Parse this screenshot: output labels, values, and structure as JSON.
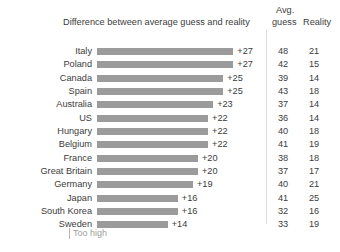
{
  "top_clip_text": "",
  "header": {
    "difference_label": "Difference between average guess and reality",
    "avg_line1": "Avg.",
    "avg_line2": "guess",
    "reality_label": "Reality"
  },
  "legend": {
    "too_high": "Too high"
  },
  "chart_data": {
    "type": "bar",
    "title": "Difference between average guess and reality",
    "xlabel": "",
    "ylabel": "",
    "orientation": "horizontal",
    "grid": false,
    "legend_position": "bottom-left",
    "legend_entries": [
      "Too high"
    ],
    "xlim": [
      0,
      30
    ],
    "categories": [
      "Italy",
      "Poland",
      "Canada",
      "Spain",
      "Australia",
      "US",
      "Hungary",
      "Belgium",
      "France",
      "Great Britain",
      "Germany",
      "Japan",
      "South Korea",
      "Sweden"
    ],
    "values": [
      27,
      27,
      25,
      25,
      23,
      22,
      22,
      22,
      20,
      20,
      19,
      16,
      16,
      14
    ],
    "value_labels": [
      "+27",
      "+27",
      "+25",
      "+25",
      "+23",
      "+22",
      "+22",
      "+22",
      "+20",
      "+20",
      "+19",
      "+16",
      "+16",
      "+14"
    ],
    "columns": [
      "Difference between average guess and reality",
      "Avg. guess",
      "Reality"
    ],
    "series": [
      {
        "name": "Difference",
        "values": [
          27,
          27,
          25,
          25,
          23,
          22,
          22,
          22,
          20,
          20,
          19,
          16,
          16,
          14
        ]
      },
      {
        "name": "Avg. guess",
        "values": [
          48,
          42,
          39,
          43,
          37,
          36,
          40,
          41,
          38,
          37,
          40,
          41,
          32,
          33
        ]
      },
      {
        "name": "Reality",
        "values": [
          21,
          15,
          14,
          18,
          14,
          14,
          18,
          19,
          18,
          17,
          21,
          25,
          16,
          19
        ]
      }
    ],
    "colors": {
      "bar": "#9b9b9b",
      "text": "#3c3c3c",
      "legend_text": "#a0a0a0"
    }
  },
  "rows": [
    {
      "country": "Italy",
      "diff": "+27",
      "avg": "48",
      "reality": "21"
    },
    {
      "country": "Poland",
      "diff": "+27",
      "avg": "42",
      "reality": "15"
    },
    {
      "country": "Canada",
      "diff": "+25",
      "avg": "39",
      "reality": "14"
    },
    {
      "country": "Spain",
      "diff": "+25",
      "avg": "43",
      "reality": "18"
    },
    {
      "country": "Australia",
      "diff": "+23",
      "avg": "37",
      "reality": "14"
    },
    {
      "country": "US",
      "diff": "+22",
      "avg": "36",
      "reality": "14"
    },
    {
      "country": "Hungary",
      "diff": "+22",
      "avg": "40",
      "reality": "18"
    },
    {
      "country": "Belgium",
      "diff": "+22",
      "avg": "41",
      "reality": "19"
    },
    {
      "country": "France",
      "diff": "+20",
      "avg": "38",
      "reality": "18"
    },
    {
      "country": "Great Britain",
      "diff": "+20",
      "avg": "37",
      "reality": "17"
    },
    {
      "country": "Germany",
      "diff": "+19",
      "avg": "40",
      "reality": "21"
    },
    {
      "country": "Japan",
      "diff": "+16",
      "avg": "41",
      "reality": "25"
    },
    {
      "country": "South Korea",
      "diff": "+16",
      "avg": "32",
      "reality": "16"
    },
    {
      "country": "Sweden",
      "diff": "+14",
      "avg": "33",
      "reality": "19"
    }
  ]
}
